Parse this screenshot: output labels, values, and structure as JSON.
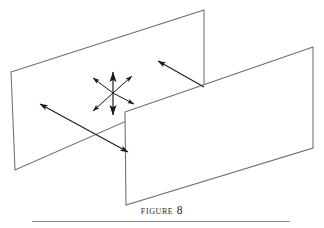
{
  "figure": {
    "caption": "Figure 8",
    "caption_display": "Figure 8",
    "alt_description": "Two intersecting vertical planes shown in perspective with a six-arrow starburst and two long directional arrows",
    "colors": {
      "background": "#ffffff",
      "plane_stroke": "#6e6e72",
      "arrow_stroke": "#1a1a1a",
      "rule": "#8d8d8d",
      "caption_text": "#2a2a2a"
    },
    "planes": [
      {
        "name": "back-plane",
        "points": "11,72 204,10 204,87 15,170"
      },
      {
        "name": "front-plane",
        "points": "125,112 313,47 313,148 126,205"
      }
    ],
    "starburst": {
      "name": "six-arrow-starburst",
      "center_x": 113,
      "center_y": 93,
      "arrow_count": 6,
      "arrows": [
        {
          "label": "arrow-up",
          "x1": 113,
          "y1": 93,
          "x2": 113,
          "y2": 72
        },
        {
          "label": "arrow-up-right",
          "x1": 113,
          "y1": 93,
          "x2": 132,
          "y2": 76
        },
        {
          "label": "arrow-down-right",
          "x1": 113,
          "y1": 93,
          "x2": 134,
          "y2": 104
        },
        {
          "label": "arrow-down",
          "x1": 113,
          "y1": 93,
          "x2": 113,
          "y2": 115
        },
        {
          "label": "arrow-down-left",
          "x1": 113,
          "y1": 93,
          "x2": 93,
          "y2": 111
        },
        {
          "label": "arrow-up-left",
          "x1": 113,
          "y1": 93,
          "x2": 93,
          "y2": 78
        }
      ]
    },
    "long_arrows": [
      {
        "label": "arrow-to-upper-left-plane",
        "x1": 204,
        "y1": 87,
        "x2": 158,
        "y2": 61,
        "heads": "end"
      },
      {
        "label": "arrow-double-across-planes",
        "x1": 40,
        "y1": 104,
        "x2": 128,
        "y2": 152,
        "heads": "both"
      }
    ],
    "rule": {
      "x": 32,
      "y": 221,
      "width": 258
    }
  }
}
